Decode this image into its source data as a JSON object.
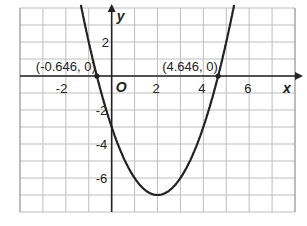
{
  "chart_data": {
    "type": "line",
    "title": "",
    "function": "y = x^2 - 4x - 3",
    "xlabel": "x",
    "ylabel": "y",
    "origin_label": "O",
    "xlim": [
      -4,
      8
    ],
    "ylim": [
      -8,
      4
    ],
    "grid": true,
    "x_ticks": [
      {
        "value": -2,
        "label": "-2"
      },
      {
        "value": 2,
        "label": "2"
      },
      {
        "value": 4,
        "label": "4"
      },
      {
        "value": 6,
        "label": "6"
      }
    ],
    "y_ticks": [
      {
        "value": 2,
        "label": "2"
      },
      {
        "value": -2,
        "label": "-2"
      },
      {
        "value": -4,
        "label": "-4"
      },
      {
        "value": -6,
        "label": "-6"
      }
    ],
    "annotations": [
      {
        "x": -0.646,
        "y": 0,
        "label": "(-0.646, 0)"
      },
      {
        "x": 4.646,
        "y": 0,
        "label": "(4.646, 0)"
      }
    ],
    "series": [
      {
        "name": "parabola",
        "vertex": [
          2,
          -7
        ],
        "y_intercept": -3,
        "roots": [
          -0.646,
          4.646
        ]
      }
    ]
  }
}
